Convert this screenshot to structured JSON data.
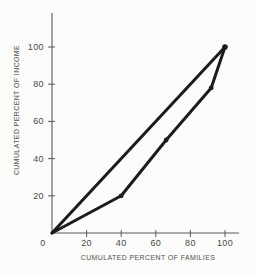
{
  "figure": {
    "colors": {
      "background": "#fbfbf9",
      "line": "#1b1b1b",
      "axis": "#5a5a5a",
      "text": "#4a4a4a"
    }
  },
  "chart_data": {
    "type": "line",
    "title": "",
    "xlabel": "CUMULATED PERCENT OF FAMILIES",
    "ylabel": "CUMULATED PERCENT OF INCOME",
    "xlim": [
      0,
      100
    ],
    "ylim": [
      0,
      100
    ],
    "xticks": [
      0,
      20,
      40,
      60,
      80,
      100
    ],
    "yticks": [
      20,
      40,
      60,
      80,
      100
    ],
    "grid": false,
    "legend": "none",
    "series": [
      {
        "name": "line-of-equality",
        "points": [
          [
            0,
            0
          ],
          [
            100,
            100
          ]
        ],
        "markers": [
          [
            100,
            100
          ]
        ]
      },
      {
        "name": "lorenz-curve",
        "points": [
          [
            0,
            0
          ],
          [
            40,
            20
          ],
          [
            66,
            50
          ],
          [
            92,
            78
          ],
          [
            100,
            100
          ]
        ],
        "markers": [
          [
            40,
            20
          ],
          [
            66,
            50
          ],
          [
            92,
            78
          ]
        ]
      }
    ]
  }
}
